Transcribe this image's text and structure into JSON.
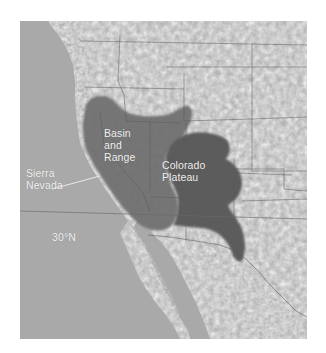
{
  "map": {
    "region": "Western United States and northwestern Mexico shaded-relief map",
    "colors": {
      "ocean": "#a9a9a9",
      "land": "#dedede",
      "relief_dark": "#8a8a8a",
      "basin_and_range_shade": "#6e6e6e",
      "colorado_plateau_shade": "#5a5a5a",
      "borders": "#6a6a6a",
      "label_text": "#f2f2f2"
    },
    "labels": {
      "basin_line1": "Basin",
      "basin_line2": "and",
      "basin_line3": "Range",
      "plateau_line1": "Colorado",
      "plateau_line2": "Plateau",
      "sierra_line1": "Sierra",
      "sierra_line2": "Nevada",
      "latitude": "30°N"
    }
  }
}
